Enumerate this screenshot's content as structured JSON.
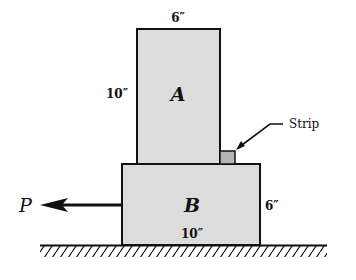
{
  "diagram": {
    "blocks": [
      {
        "id": "A",
        "label": "A",
        "width_label": "6″",
        "height_label": "10″"
      },
      {
        "id": "B",
        "label": "B",
        "width_label": "10″",
        "height_label": "6″"
      }
    ],
    "strip": {
      "label": "Strip"
    },
    "force": {
      "label": "P",
      "direction": "left"
    },
    "colors": {
      "block_fill": "#dcdcdc",
      "strip_fill": "#b4b4b4",
      "stroke": "#111111"
    }
  }
}
